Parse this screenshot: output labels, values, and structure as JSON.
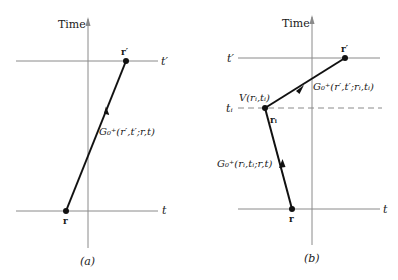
{
  "panel_a": {
    "caption": "(a)",
    "axis_label": "Time",
    "top_time_label": "t′",
    "bottom_time_label": "t",
    "top_point_label": "r′",
    "bottom_point_label": "r",
    "propagator_label": "G₀⁺(r′,t′;r,t)"
  },
  "panel_b": {
    "caption": "(b)",
    "axis_label": "Time",
    "top_time_label": "t′",
    "middle_time_label": "tᵢ",
    "bottom_time_label": "t",
    "top_point_label": "r′",
    "middle_point_label": "rᵢ",
    "bottom_point_label": "r",
    "interaction_label": "V(rᵢ,tᵢ)",
    "upper_propagator_label": "G₀⁺(r′,t′;rᵢ,tᵢ)",
    "lower_propagator_label": "G₀⁺(rᵢ,tᵢ;r,t)"
  },
  "colors": {
    "axis": "#8a8a8a",
    "path": "#111111",
    "text": "#1a1a1a"
  }
}
